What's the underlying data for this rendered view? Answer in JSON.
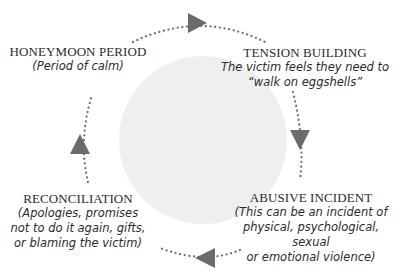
{
  "diagram": {
    "center_circle_color": "#efefef",
    "arrow_color": "#6b6b6b",
    "stages": [
      {
        "id": "honeymoon",
        "title": "HONEYMOON PERIOD",
        "description": "(Period of calm)"
      },
      {
        "id": "tension",
        "title": "TENSION BUILDING",
        "description": "The victim feels they need to\n“walk on eggshells”"
      },
      {
        "id": "abusive",
        "title": "ABUSIVE INCIDENT",
        "description": "(This can be an incident of\nphysical, psychological, sexual\nor emotional violence)"
      },
      {
        "id": "reconciliation",
        "title": "RECONCILIATION",
        "description": "(Apologies, promises\nnot to do it again, gifts,\nor blaming the victim)"
      }
    ],
    "flow": [
      "honeymoon",
      "tension",
      "abusive",
      "reconciliation",
      "honeymoon"
    ]
  }
}
